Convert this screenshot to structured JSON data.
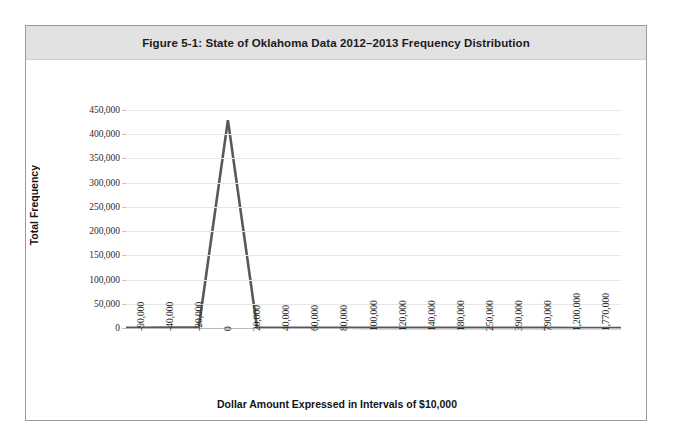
{
  "figure": {
    "title": "Figure 5-1: State of Oklahoma Data 2012–2013 Frequency Distribution"
  },
  "chart_data": {
    "type": "line",
    "title": "Figure 5-1: State of Oklahoma Data 2012–2013 Frequency Distribution",
    "xlabel": "Dollar Amount Expressed in Intervals of $10,000",
    "ylabel": "Total Frequency",
    "categories": [
      "-90,000",
      "-40,000",
      "-20,000",
      "0",
      "20,000",
      "40,000",
      "60,000",
      "80,000",
      "100,000",
      "120,000",
      "140,000",
      "180,000",
      "250,000",
      "390,000",
      "790,000",
      "1,200,000",
      "1,770,000"
    ],
    "values": [
      500,
      700,
      1200,
      429000,
      900,
      600,
      450,
      400,
      350,
      300,
      280,
      250,
      220,
      200,
      180,
      150,
      120
    ],
    "ylim": [
      0,
      450000
    ],
    "yticks": [
      "0",
      "50,000",
      "100,000",
      "150,000",
      "200,000",
      "250,000",
      "300,000",
      "350,000",
      "400,000",
      "450,000"
    ],
    "ytick_values": [
      0,
      50000,
      100000,
      150000,
      200000,
      250000,
      300000,
      350000,
      400000,
      450000
    ],
    "grid": true,
    "legend": false,
    "series_color": "#595959"
  }
}
